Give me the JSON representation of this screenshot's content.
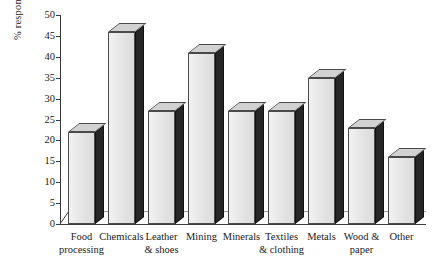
{
  "chart_data": {
    "type": "bar",
    "title": "",
    "subtitle": "",
    "xlabel": "",
    "ylabel": "% responding \"yes\"",
    "ylim": [
      0,
      50
    ],
    "ytick_step": 5,
    "yticks": [
      50,
      45,
      40,
      35,
      30,
      25,
      20,
      15,
      10,
      5,
      0
    ],
    "grid": false,
    "legend": null,
    "style": "3d-column",
    "categories": [
      "Food processing",
      "Chemicals",
      "Leather & shoes",
      "Mining",
      "Minerals",
      "Textiles & clothing",
      "Metals",
      "Wood & paper",
      "Other"
    ],
    "category_lines": [
      [
        "Food",
        "processing"
      ],
      [
        "Chemicals"
      ],
      [
        "Leather",
        "& shoes"
      ],
      [
        "Mining"
      ],
      [
        "Minerals"
      ],
      [
        "Textiles",
        "& clothing"
      ],
      [
        "Metals"
      ],
      [
        "Wood &",
        "paper"
      ],
      [
        "Other"
      ]
    ],
    "values": [
      22,
      46,
      27,
      41,
      27,
      27,
      35,
      23,
      16
    ],
    "series": [
      {
        "name": "% responding \"yes\"",
        "values": [
          22,
          46,
          27,
          41,
          27,
          27,
          35,
          23,
          16
        ]
      }
    ],
    "colors": {
      "bar_front": "#e4e4e4",
      "bar_side": "#262626",
      "bar_top": "#d2d2d2",
      "axis": "#3a3a3a",
      "background": "#ffffff",
      "text": "#1a1a1a"
    }
  }
}
